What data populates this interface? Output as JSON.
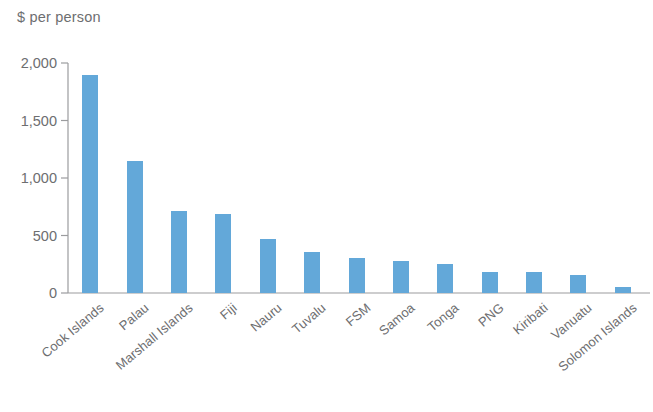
{
  "chart_data": {
    "type": "bar",
    "title": "$ per person",
    "xlabel": "",
    "ylabel": "$ per person",
    "ylim": [
      0,
      2000
    ],
    "yticks": [
      0,
      500,
      1000,
      1500,
      2000
    ],
    "ytick_labels": [
      "0",
      "500",
      "1,000",
      "1,500",
      "2,000"
    ],
    "grid": false,
    "legend": null,
    "bar_color": "#63a8d9",
    "axis_color": "#9b9c9e",
    "text_color": "#6d6e70",
    "categories": [
      "Cook Islands",
      "Palau",
      "Marshall Islands",
      "Fiji",
      "Nauru",
      "Tuvalu",
      "FSM",
      "Samoa",
      "Tonga",
      "PNG",
      "Kiribati",
      "Vanuatu",
      "Solomon Islands"
    ],
    "values": [
      1900,
      1150,
      710,
      690,
      470,
      360,
      305,
      275,
      250,
      185,
      180,
      160,
      50
    ]
  }
}
